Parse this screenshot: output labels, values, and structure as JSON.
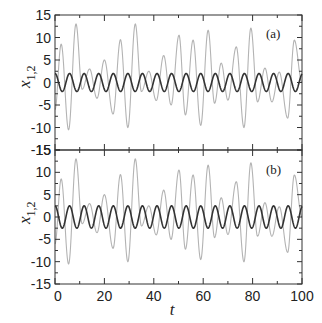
{
  "chart_data": [
    {
      "type": "line",
      "panel_label": "(a)",
      "xlabel": "",
      "ylabel": "x_{1,2}",
      "xlim": [
        0,
        100
      ],
      "ylim": [
        -15,
        15
      ],
      "yticks": [
        -15,
        -10,
        -5,
        0,
        5,
        10,
        15
      ],
      "ytick_labels": [
        "-15",
        "-10",
        "-5",
        "0",
        "5",
        "10",
        "15"
      ],
      "xticks": [
        0,
        20,
        40,
        60,
        80,
        100
      ],
      "xtick_labels_visible": false,
      "grid": false,
      "legend": false,
      "series": [
        {
          "name": "x1 (dark)",
          "color": "#333333",
          "style": "sinusoid",
          "amplitude": 2.0,
          "period": 5.9,
          "phase_deg": 90
        },
        {
          "name": "x2 (grey)",
          "color": "#b3b3b3",
          "style": "extrema",
          "t": [
            0,
            2.5,
            5.5,
            8.5,
            11,
            14,
            17,
            20,
            23.5,
            26.5,
            29.5,
            32.5,
            35,
            38,
            41,
            44,
            47,
            50.2,
            52.8,
            55.9,
            59,
            62,
            64.6,
            67.3,
            70,
            73.4,
            76.5,
            79.3,
            82,
            85,
            87.8,
            90.8,
            94.2,
            96.9,
            100
          ],
          "values": [
            -6,
            8.5,
            -10.5,
            13,
            -1.5,
            3,
            -3.5,
            5,
            -7,
            9.5,
            -10,
            13,
            -2,
            2.5,
            -4,
            6,
            -5,
            10.5,
            -7.2,
            9.4,
            -9.5,
            11.6,
            -4.6,
            4.3,
            -3.9,
            7.9,
            -10,
            12.1,
            -4.3,
            3.2,
            -4.3,
            2.3,
            -7.9,
            9.4,
            0
          ]
        }
      ]
    },
    {
      "type": "line",
      "panel_label": "(b)",
      "xlabel": "t",
      "ylabel": "x_{1,2}",
      "xlim": [
        0,
        100
      ],
      "ylim": [
        -15,
        15
      ],
      "yticks": [
        -15,
        -10,
        -5,
        0,
        5,
        10,
        15
      ],
      "ytick_labels": [
        "-15",
        "-10",
        "-5",
        "0",
        "5",
        "10",
        "15"
      ],
      "xticks": [
        0,
        20,
        40,
        60,
        80,
        100
      ],
      "xtick_labels": [
        "0",
        "20",
        "40",
        "60",
        "80",
        "100"
      ],
      "grid": false,
      "legend": false,
      "series": [
        {
          "name": "x1 (dark)",
          "color": "#333333",
          "style": "sinusoid",
          "amplitude": 2.5,
          "period": 5.9,
          "phase_deg": 90
        },
        {
          "name": "x2 (grey)",
          "color": "#b3b3b3",
          "style": "extrema",
          "t": [
            0,
            2.5,
            5.5,
            8.5,
            11,
            14,
            17,
            20,
            23.5,
            26.5,
            29.5,
            32.5,
            35,
            38,
            41,
            44,
            47,
            50.2,
            52.8,
            55.9,
            59,
            62,
            64.6,
            67.3,
            70,
            73.4,
            76.5,
            79.3,
            82,
            85,
            87.8,
            90.8,
            94.2,
            96.9,
            100
          ],
          "values": [
            -6,
            8.5,
            -10.5,
            13,
            -1.5,
            3,
            -3.5,
            5,
            -7,
            9.5,
            -10,
            13,
            -2,
            2.5,
            -4,
            6,
            -5,
            10.5,
            -7.2,
            9.4,
            -9.5,
            11.6,
            -4.6,
            4.3,
            -3.9,
            7.9,
            -10,
            12.1,
            -4.3,
            3.2,
            -4.3,
            2.3,
            -7.9,
            9.4,
            0
          ]
        }
      ]
    }
  ],
  "labels": {
    "panel_a": "(a)",
    "panel_b": "(b)",
    "ylabel_main": "x",
    "ylabel_sub": "1,2",
    "xlabel": "t"
  },
  "colors": {
    "axis": "#333333",
    "dark_series": "#333333",
    "grey_series": "#b3b3b3"
  }
}
